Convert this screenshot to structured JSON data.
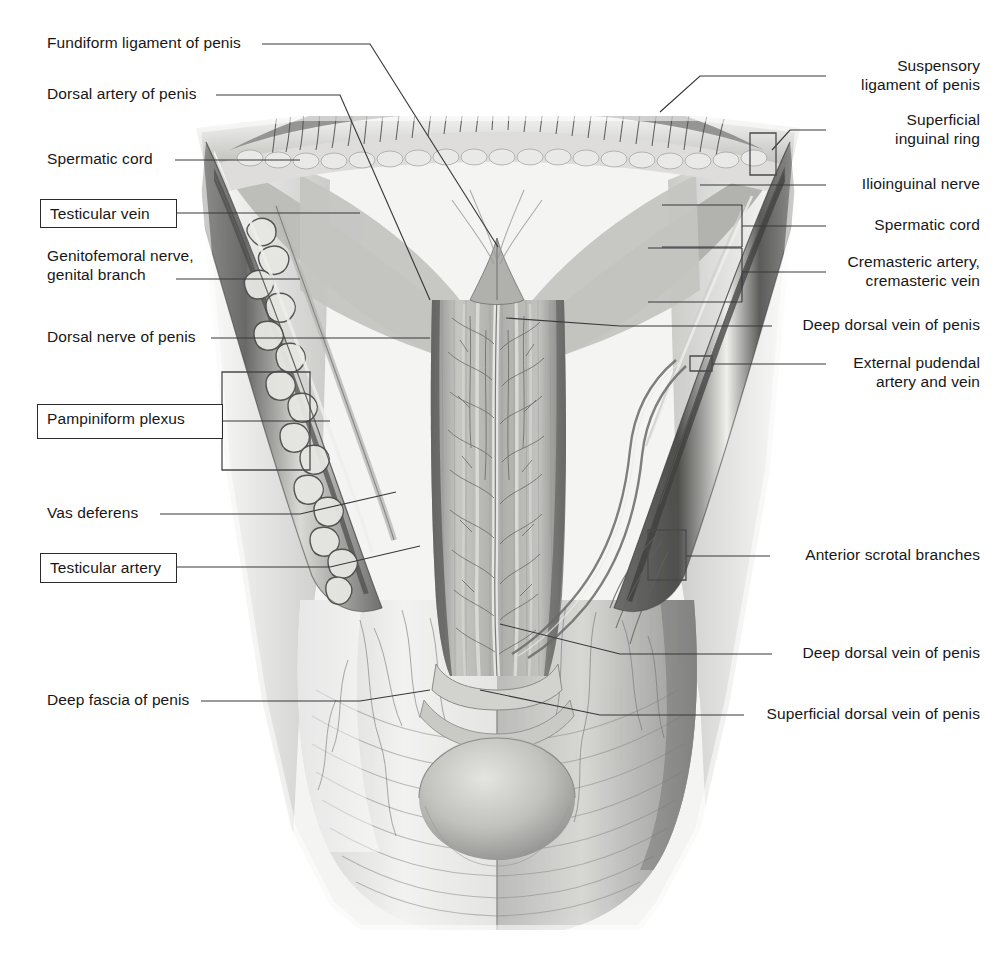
{
  "figure": {
    "kind": "anatomical-illustration",
    "style": "grayscale pencil/airbrush medical drawing",
    "background_color": "#ffffff",
    "line_color": "#39393b",
    "text_color": "#171717"
  },
  "labels_left": [
    {
      "id": "fundiform-ligament-of-penis",
      "text": "Fundiform ligament of penis",
      "boxed": false
    },
    {
      "id": "dorsal-artery-of-penis",
      "text": "Dorsal artery of penis",
      "boxed": false
    },
    {
      "id": "spermatic-cord-left",
      "text": "Spermatic cord",
      "boxed": false
    },
    {
      "id": "testicular-vein",
      "text": "Testicular vein",
      "boxed": true
    },
    {
      "id": "genitofemoral-nerve",
      "text": "Genitofemoral nerve,\ngenital branch",
      "boxed": false
    },
    {
      "id": "dorsal-nerve-of-penis",
      "text": "Dorsal nerve of penis",
      "boxed": false
    },
    {
      "id": "pampiniform-plexus",
      "text": "Pampiniform plexus",
      "boxed": true
    },
    {
      "id": "vas-deferens",
      "text": "Vas deferens",
      "boxed": false
    },
    {
      "id": "testicular-artery",
      "text": "Testicular artery",
      "boxed": true
    },
    {
      "id": "deep-fascia-of-penis",
      "text": "Deep fascia of penis",
      "boxed": false
    }
  ],
  "labels_right": [
    {
      "id": "suspensory-ligament-of-penis",
      "text": "Suspensory\nligament of penis"
    },
    {
      "id": "superficial-inguinal-ring",
      "text": "Superficial\ninguinal ring"
    },
    {
      "id": "ilioinguinal-nerve",
      "text": "Ilioinguinal nerve"
    },
    {
      "id": "spermatic-cord-right",
      "text": "Spermatic cord"
    },
    {
      "id": "cremasteric-vessels",
      "text": "Cremasteric artery,\ncremasteric vein"
    },
    {
      "id": "deep-dorsal-vein-upper",
      "text": "Deep dorsal vein of penis"
    },
    {
      "id": "external-pudendal-vessels",
      "text": "External pudendal\nartery and vein"
    },
    {
      "id": "anterior-scrotal-branches",
      "text": "Anterior scrotal branches"
    },
    {
      "id": "deep-dorsal-vein-lower",
      "text": "Deep dorsal vein of penis"
    },
    {
      "id": "superficial-dorsal-vein",
      "text": "Superficial dorsal vein of penis"
    }
  ]
}
